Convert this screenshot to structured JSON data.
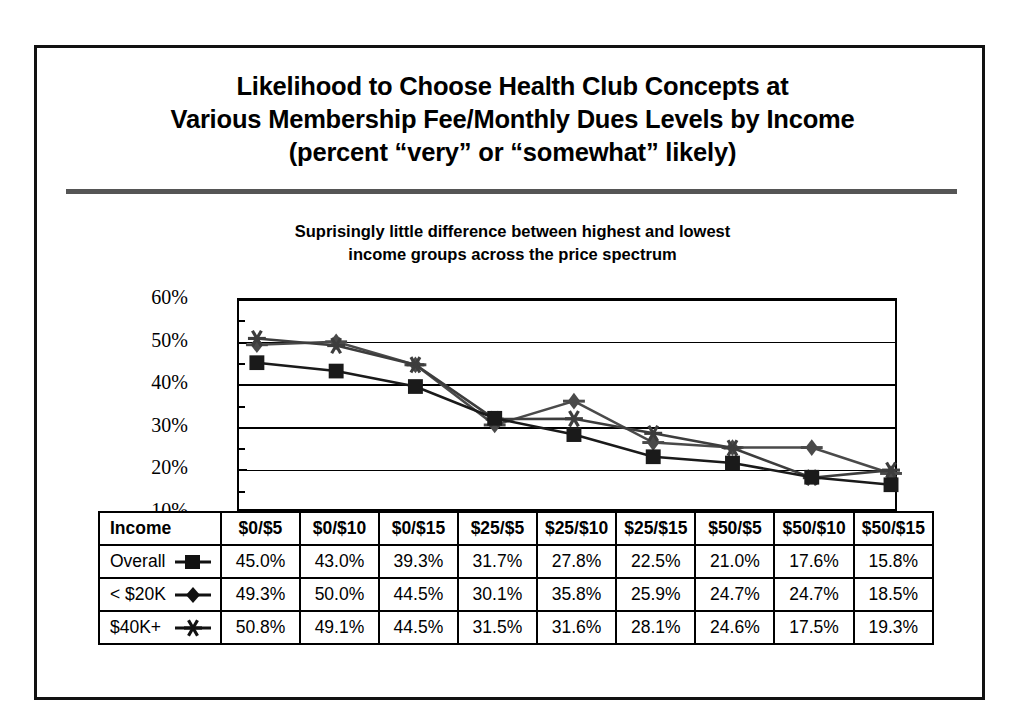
{
  "slide": {
    "title_lines": [
      "Likelihood to Choose Health Club Concepts at",
      "Various Membership Fee/Monthly Dues Levels by Income",
      "(percent “very” or “somewhat” likely)"
    ],
    "subtitle_lines": [
      "Suprisingly little difference between highest and lowest",
      "income groups across the price spectrum"
    ]
  },
  "chart_data": {
    "type": "line",
    "title": "Likelihood to Choose Health Club Concepts at Various Membership Fee/Monthly Dues Levels by Income (percent “very” or “somewhat” likely)",
    "subtitle": "Suprisingly little difference between highest and lowest income groups across the price spectrum",
    "xlabel": "",
    "ylabel": "",
    "categories": [
      "$0/$5",
      "$0/$10",
      "$0/$15",
      "$25/$5",
      "$25/$10",
      "$25/$15",
      "$50/$5",
      "$50/$10",
      "$50/$15"
    ],
    "ylim": [
      10,
      60
    ],
    "yticks": [
      "10%",
      "20%",
      "30%",
      "40%",
      "50%",
      "60%"
    ],
    "ytick_values": [
      10,
      20,
      30,
      40,
      50,
      60
    ],
    "minor_tick_values": [
      15,
      25,
      35,
      45,
      55
    ],
    "grid": true,
    "legend_position": "table-below",
    "series": [
      {
        "name": "Overall",
        "marker": "square",
        "color": "#1a1a1a",
        "line_color": "#1a1a1a",
        "values": [
          45.0,
          43.0,
          39.3,
          31.7,
          27.8,
          22.5,
          21.0,
          17.6,
          15.8
        ],
        "labels": [
          "45.0%",
          "43.0%",
          "39.3%",
          "31.7%",
          "27.8%",
          "22.5%",
          "21.0%",
          "17.6%",
          "15.8%"
        ]
      },
      {
        "name": "< $20K",
        "marker": "diamond",
        "color": "#4a4a4a",
        "line_color": "#4a4a4a",
        "values": [
          49.3,
          50.0,
          44.5,
          30.1,
          35.8,
          25.9,
          24.7,
          24.7,
          18.5
        ],
        "labels": [
          "49.3%",
          "50.0%",
          "44.5%",
          "30.1%",
          "35.8%",
          "25.9%",
          "24.7%",
          "24.7%",
          "18.5%"
        ]
      },
      {
        "name": "$40K+",
        "marker": "asterisk",
        "color": "#3d3d3d",
        "line_color": "#3d3d3d",
        "values": [
          50.8,
          49.1,
          44.5,
          31.5,
          31.6,
          28.1,
          24.6,
          17.5,
          19.3
        ],
        "labels": [
          "50.8%",
          "49.1%",
          "44.5%",
          "31.5%",
          "31.6%",
          "28.1%",
          "24.6%",
          "17.5%",
          "19.3%"
        ]
      }
    ]
  },
  "table": {
    "header_label": "Income",
    "columns": [
      "$0/$5",
      "$0/$10",
      "$0/$15",
      "$25/$5",
      "$25/$10",
      "$25/$15",
      "$50/$5",
      "$50/$10",
      "$50/$15"
    ],
    "rows": [
      {
        "label": "Overall",
        "marker": "square",
        "values": [
          "45.0%",
          "43.0%",
          "39.3%",
          "31.7%",
          "27.8%",
          "22.5%",
          "21.0%",
          "17.6%",
          "15.8%"
        ]
      },
      {
        "label": "< $20K",
        "marker": "diamond",
        "values": [
          "49.3%",
          "50.0%",
          "44.5%",
          "30.1%",
          "35.8%",
          "25.9%",
          "24.7%",
          "24.7%",
          "18.5%"
        ]
      },
      {
        "label": "$40K+",
        "marker": "asterisk",
        "values": [
          "50.8%",
          "49.1%",
          "44.5%",
          "31.5%",
          "31.6%",
          "28.1%",
          "24.6%",
          "17.5%",
          "19.3%"
        ]
      }
    ]
  },
  "colors": {
    "frame": "#111111",
    "rule": "#555555",
    "overall": "#1a1a1a",
    "under20k": "#4a4a4a",
    "over40k": "#3d3d3d"
  }
}
